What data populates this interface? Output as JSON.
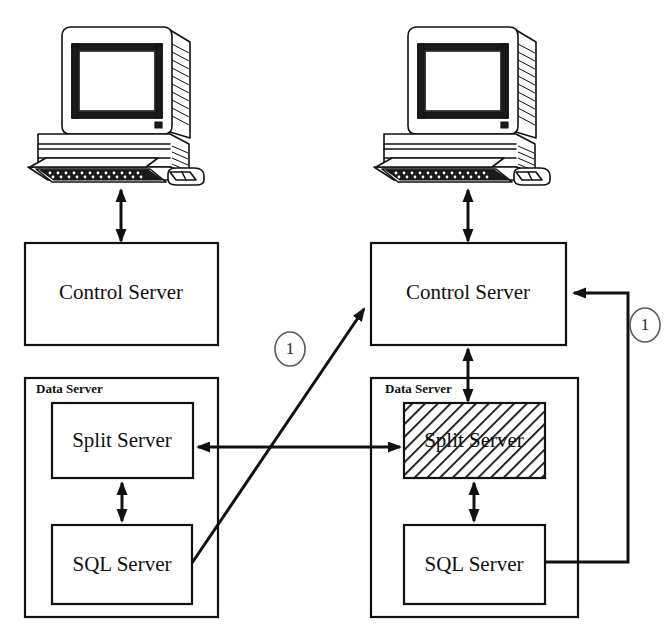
{
  "diagram": {
    "background_color": "#ffffff",
    "line_color": "#111111",
    "hatch_color": "#111111",
    "marker_circle_color": "#5a5a5a"
  },
  "nodes": {
    "left_workstation": {
      "icon": "desktop-computer-icon",
      "label": ""
    },
    "right_workstation": {
      "icon": "desktop-computer-icon",
      "label": ""
    },
    "left_control_server": {
      "label": "Control Server"
    },
    "right_control_server": {
      "label": "Control Server"
    },
    "left_data_server": {
      "label": "Data Server"
    },
    "right_data_server": {
      "label": "Data Server"
    },
    "left_split_server": {
      "label": "Split Server",
      "hatched": false
    },
    "right_split_server": {
      "label": "Split Server",
      "hatched": true
    },
    "left_sql_server": {
      "label": "SQL Server"
    },
    "right_sql_server": {
      "label": "SQL Server"
    }
  },
  "markers": [
    {
      "id": "marker-left",
      "label": "1"
    },
    {
      "id": "marker-right",
      "label": "1"
    }
  ],
  "connections": [
    {
      "id": "left-workstation-to-control",
      "arrow": "both",
      "orientation": "vertical"
    },
    {
      "id": "right-workstation-to-control",
      "arrow": "both",
      "orientation": "vertical"
    },
    {
      "id": "right-control-to-split",
      "arrow": "both",
      "orientation": "vertical"
    },
    {
      "id": "left-split-to-sql",
      "arrow": "both",
      "orientation": "vertical"
    },
    {
      "id": "right-split-to-sql",
      "arrow": "both",
      "orientation": "vertical"
    },
    {
      "id": "split-to-split",
      "arrow": "both",
      "orientation": "horizontal"
    },
    {
      "id": "left-sql-to-right-control",
      "arrow": "end",
      "orientation": "diagonal",
      "marker": "1"
    },
    {
      "id": "right-sql-to-right-control",
      "arrow": "end",
      "orientation": "elbow",
      "marker": "1"
    }
  ]
}
